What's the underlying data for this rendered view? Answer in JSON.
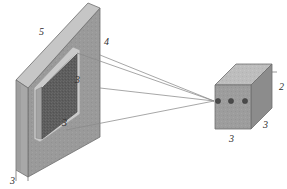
{
  "figure": {
    "type": "technical-line-diagram",
    "background_color": "#ffffff",
    "width": 287,
    "height": 189
  },
  "palette": {
    "outline": "#6e6e6e",
    "ray_line": "#8a8a8a",
    "panel_front": "#9a9a9a",
    "panel_top_bevel": "#c6c6c6",
    "panel_left_edge": "#a8a8a8",
    "panel_left_edge_shade": "#8e8e8e",
    "inner_screen_dark": "#5d5d5d",
    "inner_screen_frame": "#cbcbcb",
    "inner_screen_side": "#a3a3a3",
    "cube_front": "#9d9d9d",
    "cube_top": "#bdbdbd",
    "cube_right": "#8c8c8c",
    "aperture_dot": "#4a4a4a",
    "label_text": "#2b2b2b"
  },
  "parts": {
    "panel": {
      "name": "large flat panel / frame",
      "callout": "4"
    },
    "panel_bevel": {
      "name": "panel top bevel face",
      "callout": "5"
    },
    "panel_base_edge": {
      "name": "panel lower left side edge",
      "callout": "3"
    },
    "inner_screen": {
      "name": "recessed dark emitter plate",
      "callout_upper": "3",
      "callout_lower": "3"
    },
    "cube": {
      "name": "sensor block / detector housing",
      "callout": "2",
      "callout_bottom": "3",
      "callout_right": "3"
    },
    "apertures": {
      "name": "three aperture dots on sensor front face",
      "count": 3
    },
    "rays": {
      "name": "projection rays converging to focal point",
      "count": 4
    }
  },
  "labels": [
    {
      "id": "label-5",
      "text": "5",
      "x": 39,
      "y": 27
    },
    {
      "id": "label-4",
      "text": "4",
      "x": 104,
      "y": 37
    },
    {
      "id": "label-3-screen-upper",
      "text": "3",
      "x": 75,
      "y": 75
    },
    {
      "id": "label-3-screen-lower",
      "text": "3",
      "x": 62,
      "y": 118
    },
    {
      "id": "label-3-panel-base",
      "text": "3",
      "x": 10,
      "y": 176
    },
    {
      "id": "label-2-cube",
      "text": "2",
      "x": 279,
      "y": 82
    },
    {
      "id": "label-3-cube-right",
      "text": "3",
      "x": 263,
      "y": 120
    },
    {
      "id": "label-3-cube-bottom",
      "text": "3",
      "x": 229,
      "y": 134
    }
  ],
  "geometry": {
    "focal_point": {
      "x": 214,
      "y": 101
    },
    "apertures_cx": [
      218,
      231,
      245
    ],
    "apertures_cy": 101,
    "aperture_r": 2.6
  }
}
